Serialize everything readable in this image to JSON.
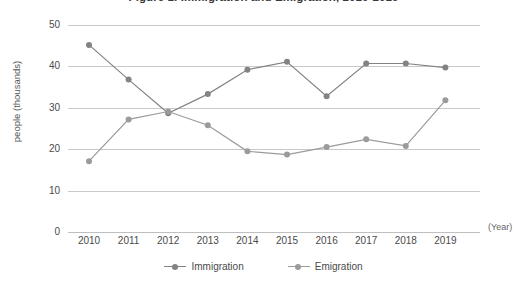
{
  "chart_data": {
    "type": "line",
    "title": "Figure 1. Immigration and Emigration, 2010-2019",
    "xlabel": "(Year)",
    "ylabel": "people (thousands)",
    "categories": [
      "2010",
      "2011",
      "2012",
      "2013",
      "2014",
      "2015",
      "2016",
      "2017",
      "2018",
      "2019"
    ],
    "ylim": [
      0,
      50
    ],
    "yticks": [
      0,
      10,
      20,
      30,
      40,
      50
    ],
    "grid": true,
    "legend_position": "bottom",
    "series": [
      {
        "name": "Immigration",
        "color": "#838383",
        "values": [
          45.2,
          36.8,
          28.7,
          33.3,
          39.2,
          41.1,
          32.8,
          40.7,
          40.7,
          39.7
        ]
      },
      {
        "name": "Emigration",
        "color": "#9b9b9b",
        "values": [
          17.1,
          27.2,
          29.1,
          25.8,
          19.5,
          18.7,
          20.5,
          22.4,
          20.8,
          31.8
        ]
      }
    ]
  },
  "axis": {
    "y_tick_labels": [
      "50",
      "40",
      "30",
      "20",
      "10",
      "0"
    ],
    "y_title": "people (thousands)",
    "x_title": "(Year)"
  },
  "legend": {
    "items": [
      {
        "label": "Immigration",
        "color": "#838383"
      },
      {
        "label": "Emigration",
        "color": "#9b9b9b"
      }
    ]
  },
  "colors": {
    "immigration": "#838383",
    "emigration": "#9b9b9b",
    "gridline": "#c9c9c9",
    "text": "#4a4a4a",
    "background": "#ffffff"
  }
}
